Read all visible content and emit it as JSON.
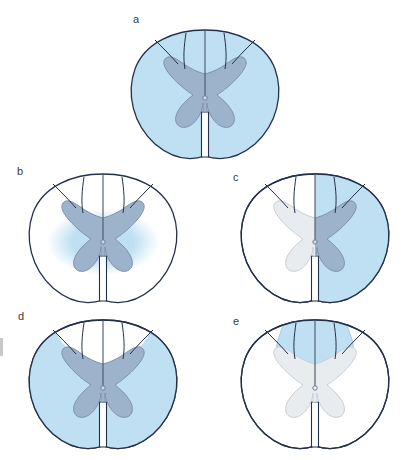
{
  "figure": {
    "panel_count": 5,
    "background_color": "#ffffff"
  },
  "colors": {
    "outline": "#23304a",
    "affected_white_matter": "#bfe0f2",
    "affected_white_matter_stroke": "#8cc4e2",
    "affected_gray_matter": "#9db3cc",
    "spared_gray_matter": "#e9ecef",
    "spared_gray_matter_stroke": "#c9cfd6",
    "gray_matter_stroke": "#7f93ab",
    "sulcus_line": "#4a5568",
    "label_text": "#3a3a3a",
    "central_canal": "#6b7f96"
  },
  "panels": [
    {
      "id": "a",
      "label": "a",
      "label_x": 133,
      "label_y": 14,
      "center_x": 205,
      "center_y": 93,
      "pattern": "complete-cord-lesion",
      "description": "Complete transverse lesion: entire white matter and gray matter shaded.",
      "white_matter_affected": true,
      "gray_matter_affected": true,
      "shaded_region": "whole-cross-section"
    },
    {
      "id": "b",
      "label": "b",
      "label_x": 17,
      "label_y": 166,
      "center_x": 103,
      "center_y": 237,
      "pattern": "central-cord-syndrome",
      "description": "Central cord syndrome: central oval region around gray matter shaded, peripheral white matter spared.",
      "white_matter_affected": false,
      "gray_matter_affected": true,
      "shaded_region": "central-oval"
    },
    {
      "id": "c",
      "label": "c",
      "label_x": 243,
      "label_y": 172,
      "center_x": 315,
      "center_y": 237,
      "pattern": "brown-sequard-hemisection",
      "description": "Brown-Sequard syndrome: right half of the cord shaded, left half spared.",
      "white_matter_affected": true,
      "gray_matter_affected": true,
      "shaded_region": "right-hemicord"
    },
    {
      "id": "d",
      "label": "d",
      "label_x": 18,
      "label_y": 315,
      "center_x": 103,
      "center_y": 383,
      "pattern": "anterior-cord-syndrome",
      "description": "Anterior cord syndrome: anterior two-thirds shaded, posterior columns spared.",
      "white_matter_affected": true,
      "gray_matter_affected": true,
      "shaded_region": "anterior-two-thirds"
    },
    {
      "id": "e",
      "label": "e",
      "label_x": 243,
      "label_y": 316,
      "center_x": 315,
      "center_y": 383,
      "pattern": "posterior-cord-syndrome",
      "description": "Posterior cord syndrome: dorsal columns shaded, remainder of cord spared.",
      "white_matter_affected": false,
      "gray_matter_affected": false,
      "shaded_region": "posterior-columns"
    }
  ],
  "anatomy": {
    "structures": [
      "spinal cord outline",
      "white matter",
      "gray matter",
      "dorsal horn",
      "ventral horn",
      "central canal",
      "posterior median sulcus",
      "anterior median fissure",
      "dorsal intermediate sulcus",
      "dorsal root entry zone"
    ]
  },
  "edge_artifact": {
    "present": true,
    "description": "partial cropped mark at left margin beside panel d"
  }
}
